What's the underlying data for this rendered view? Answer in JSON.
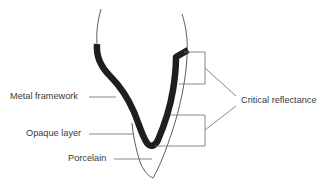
{
  "diagram": {
    "type": "labeled cross-section",
    "labels": {
      "metal_framework": "Metal framework",
      "opaque_layer": "Opaque layer",
      "porcelain": "Porcelain",
      "critical_reflectance": "Critical reflectance"
    },
    "colors": {
      "metal": "#1e1e1e",
      "outline": "#4a4a4a",
      "leader": "#6a6a6a",
      "text": "#3a3a3a",
      "background": "#ffffff"
    }
  }
}
